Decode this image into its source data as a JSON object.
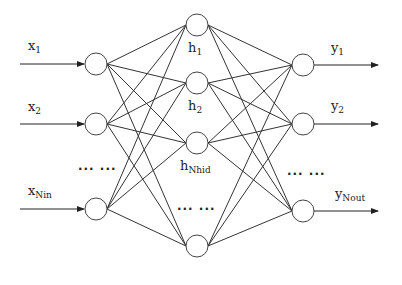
{
  "diagram": {
    "type": "feedforward-neural-network",
    "layers": {
      "input": {
        "nodes": [
          {
            "label": "x",
            "sub": "1",
            "cx": 96,
            "cy": 64
          },
          {
            "label": "x",
            "sub": "2",
            "cx": 96,
            "cy": 124
          },
          {
            "label": "x",
            "sub": "Nin",
            "cx": 96,
            "cy": 209
          }
        ],
        "ellipsis": "··· ···"
      },
      "hidden": {
        "nodes": [
          {
            "label": "h",
            "sub": "1",
            "cx": 197,
            "cy": 25
          },
          {
            "label": "h",
            "sub": "2",
            "cx": 197,
            "cy": 83
          },
          {
            "label": "h",
            "sub": "Nhid",
            "cx": 197,
            "cy": 143
          },
          {
            "label": "",
            "sub": "",
            "cx": 197,
            "cy": 246
          }
        ],
        "ellipsis": "··· ···"
      },
      "output": {
        "nodes": [
          {
            "label": "y",
            "sub": "1",
            "cx": 303,
            "cy": 65
          },
          {
            "label": "y",
            "sub": "2",
            "cx": 303,
            "cy": 124
          },
          {
            "label": "y",
            "sub": "Nout",
            "cx": 303,
            "cy": 211
          }
        ],
        "ellipsis": "··· ···"
      }
    },
    "node_radius": 11,
    "stroke_color": "#333333"
  }
}
